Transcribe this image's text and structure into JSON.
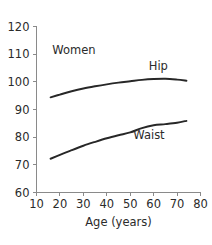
{
  "chart_data": {
    "type": "line",
    "title": "",
    "xlabel": "Age (years)",
    "ylabel": "",
    "xlim": [
      10,
      80
    ],
    "ylim": [
      60,
      120
    ],
    "xticks": [
      10,
      20,
      30,
      40,
      50,
      60,
      70,
      80
    ],
    "yticks": [
      60,
      70,
      80,
      90,
      100,
      110,
      120
    ],
    "xtick_labels": [
      "10",
      "20",
      "30",
      "40",
      "50",
      "60",
      "70",
      "80"
    ],
    "ytick_labels": [
      "60",
      "70",
      "80",
      "90",
      "100",
      "110",
      "120"
    ],
    "grid": false,
    "legend_position": "inline-annotations",
    "group_annotation": "Women",
    "series": [
      {
        "name": "Hip",
        "label": "Hip",
        "color": "#272727",
        "x": [
          16,
          20,
          25,
          30,
          35,
          40,
          45,
          50,
          55,
          60,
          65,
          70,
          74
        ],
        "values": [
          94.4,
          95.4,
          96.6,
          97.6,
          98.4,
          99.1,
          99.7,
          100.2,
          100.7,
          101.0,
          101.1,
          100.8,
          100.4
        ]
      },
      {
        "name": "Waist",
        "label": "Waist",
        "color": "#272727",
        "x": [
          16,
          20,
          25,
          30,
          35,
          40,
          45,
          50,
          55,
          60,
          65,
          70,
          74
        ],
        "values": [
          72.2,
          73.6,
          75.3,
          76.9,
          78.3,
          79.6,
          80.7,
          81.7,
          83.3,
          84.3,
          84.7,
          85.2,
          85.9
        ]
      }
    ],
    "annotations": [
      {
        "text": "Women",
        "x": 26,
        "y": 110.2
      },
      {
        "text": "Hip",
        "x": 62,
        "y": 104.3
      },
      {
        "text": "Waist",
        "x": 58,
        "y": 79.2
      }
    ]
  }
}
